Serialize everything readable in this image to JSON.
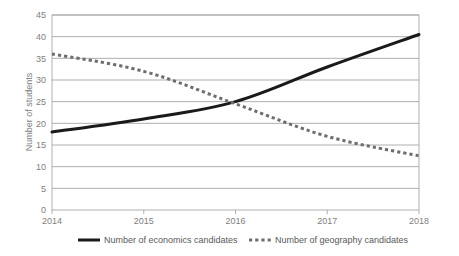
{
  "chart_data": {
    "type": "line",
    "title": "",
    "xlabel": "",
    "ylabel": "Number of students",
    "x": [
      2014,
      2015,
      2016,
      2017,
      2018
    ],
    "categories": [
      "2014",
      "2015",
      "2016",
      "2017",
      "2018"
    ],
    "xtick_labels": [
      "2014",
      "2015",
      "2016",
      "2017",
      "2018"
    ],
    "ytick_labels": [
      "0",
      "5",
      "10",
      "15",
      "20",
      "25",
      "30",
      "35",
      "40",
      "45"
    ],
    "ytick_values": [
      0,
      5,
      10,
      15,
      20,
      25,
      30,
      35,
      40,
      45
    ],
    "ylim": [
      0,
      45
    ],
    "grid": "horizontal",
    "legend_position": "bottom",
    "series": [
      {
        "name": "Number of economics candidates",
        "values": [
          18,
          21,
          25,
          33,
          40.5
        ],
        "style": "solid",
        "color": "#1a1a1a",
        "width": 3
      },
      {
        "name": "Number of geography candidates",
        "values": [
          36,
          32,
          24.5,
          17,
          12.5
        ],
        "style": "dashed",
        "color": "#6e6e6e",
        "width": 3
      }
    ]
  },
  "axes": {
    "y_axis_title": "Number of students"
  },
  "legend": {
    "items": [
      {
        "label": "Number of economics candidates",
        "marker": "solid-line-marker"
      },
      {
        "label": "Number of geography candidates",
        "marker": "dashed-line-marker"
      }
    ]
  },
  "colors": {
    "gridline": "#a6a6a6",
    "axis": "#a6a6a6",
    "tick_text": "#808080",
    "legend_text": "#595959",
    "series_economics": "#1a1a1a",
    "series_geography": "#6e6e6e",
    "background": "#ffffff"
  }
}
